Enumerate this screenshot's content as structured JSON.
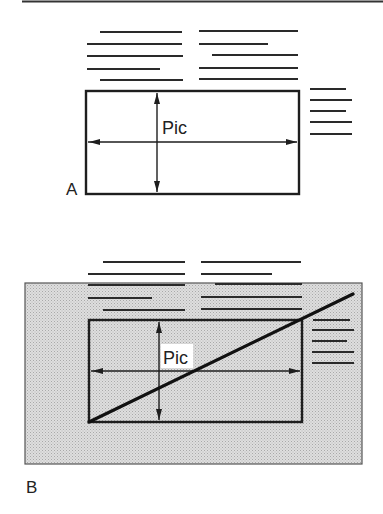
{
  "figure": {
    "top_rule": {
      "x1": 22,
      "x2": 383,
      "y": 1.5
    },
    "panels": [
      {
        "id": "A",
        "label": "A",
        "label_pos": {
          "x": 66,
          "y": 195
        },
        "shaded": false,
        "picture_box": {
          "x": 86,
          "y": 91,
          "w": 213,
          "h": 103
        },
        "picture_label": "Pic",
        "picture_label_pos": {
          "x": 162,
          "y": 134
        },
        "picture_label_bg": false,
        "vertical_arrow_x": 157,
        "horizontal_arrow_y": 142,
        "diagonal": false,
        "text_lines_above": [
          {
            "x1": 100,
            "x2": 182,
            "y": 32
          },
          {
            "x1": 87,
            "x2": 182,
            "y": 44
          },
          {
            "x1": 87,
            "x2": 183,
            "y": 56
          },
          {
            "x1": 87,
            "x2": 160,
            "y": 69
          },
          {
            "x1": 100,
            "x2": 183,
            "y": 80
          },
          {
            "x1": 199,
            "x2": 298,
            "y": 31
          },
          {
            "x1": 199,
            "x2": 268,
            "y": 44
          },
          {
            "x1": 212,
            "x2": 298,
            "y": 55
          },
          {
            "x1": 199,
            "x2": 298,
            "y": 68
          },
          {
            "x1": 199,
            "x2": 298,
            "y": 79
          }
        ],
        "text_lines_side": [
          {
            "x1": 310,
            "x2": 346,
            "y": 89
          },
          {
            "x1": 310,
            "x2": 352,
            "y": 100
          },
          {
            "x1": 310,
            "x2": 346,
            "y": 111
          },
          {
            "x1": 310,
            "x2": 352,
            "y": 122
          },
          {
            "x1": 310,
            "x2": 352,
            "y": 134
          }
        ]
      },
      {
        "id": "B",
        "label": "B",
        "label_pos": {
          "x": 26,
          "y": 493
        },
        "shaded": true,
        "shade_rect": {
          "x": 25,
          "y": 283,
          "w": 337,
          "h": 181
        },
        "picture_box": {
          "x": 89,
          "y": 320,
          "w": 213,
          "h": 102
        },
        "picture_label": "Pic",
        "picture_label_pos": {
          "x": 163,
          "y": 364
        },
        "picture_label_bg": true,
        "picture_label_bg_rect": {
          "x": 161,
          "y": 344,
          "w": 32,
          "h": 24
        },
        "vertical_arrow_x": 159,
        "horizontal_arrow_y": 371,
        "diagonal": {
          "x1": 89,
          "y1": 422,
          "x2": 353,
          "y2": 294
        },
        "text_lines_above": [
          {
            "x1": 103,
            "x2": 185,
            "y": 262
          },
          {
            "x1": 88,
            "x2": 185,
            "y": 274
          },
          {
            "x1": 88,
            "x2": 185,
            "y": 285
          },
          {
            "x1": 88,
            "x2": 152,
            "y": 298
          },
          {
            "x1": 103,
            "x2": 185,
            "y": 310
          },
          {
            "x1": 201,
            "x2": 301,
            "y": 262
          },
          {
            "x1": 201,
            "x2": 272,
            "y": 274
          },
          {
            "x1": 215,
            "x2": 302,
            "y": 284
          },
          {
            "x1": 201,
            "x2": 302,
            "y": 297
          },
          {
            "x1": 201,
            "x2": 302,
            "y": 309
          }
        ],
        "text_lines_side": [
          {
            "x1": 313,
            "x2": 350,
            "y": 320
          },
          {
            "x1": 312,
            "x2": 354,
            "y": 330
          },
          {
            "x1": 312,
            "x2": 347,
            "y": 341
          },
          {
            "x1": 312,
            "x2": 354,
            "y": 352
          },
          {
            "x1": 312,
            "x2": 354,
            "y": 363
          }
        ]
      }
    ]
  },
  "colors": {
    "ink": "#1e1e1e",
    "shade": "#d6d6d6",
    "shade_dot": "#a9a9a9",
    "paper": "#ffffff"
  }
}
